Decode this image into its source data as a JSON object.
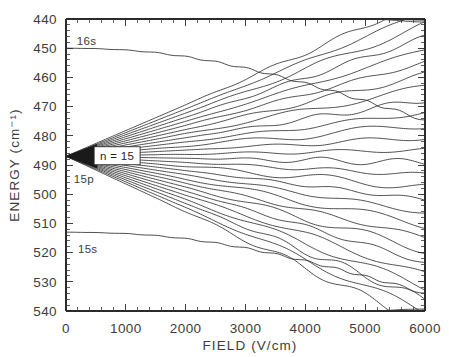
{
  "chart_data": {
    "type": "line",
    "title": "",
    "xlabel": "FIELD   (V/cm)",
    "ylabel": "ENERGY   (cm⁻¹)",
    "xlim": [
      0,
      6000
    ],
    "ylim": [
      540,
      440
    ],
    "y_inverted": true,
    "grid": false,
    "legend_position": "none",
    "x_ticks": [
      0,
      1000,
      2000,
      3000,
      4000,
      5000,
      6000
    ],
    "x_tick_labels": [
      "0",
      "1000",
      "2000",
      "3000",
      "4000",
      "5000",
      "6000"
    ],
    "x_minor_step": 200,
    "y_ticks": [
      440,
      450,
      460,
      470,
      480,
      490,
      500,
      510,
      520,
      530,
      540
    ],
    "y_tick_labels": [
      "440",
      "450",
      "460",
      "470",
      "480",
      "490",
      "500",
      "510",
      "520",
      "530",
      "540"
    ],
    "y_minor_step": 2,
    "annotations": [
      {
        "name": "manifold-label",
        "text": "n = 15",
        "x": 520,
        "y": 487,
        "boxed": true
      },
      {
        "name": "state-label-16s",
        "text": "16s",
        "x": 180,
        "y": 449
      },
      {
        "name": "state-label-15p",
        "text": "15p",
        "x": 130,
        "y": 496
      },
      {
        "name": "state-label-15s",
        "text": "15s",
        "x": 200,
        "y": 520
      }
    ],
    "manifold": {
      "origin_field": 0,
      "origin_energy": 487.0,
      "n": 15,
      "num_levels": 27,
      "slope_min": -0.0088,
      "slope_max": 0.0095,
      "description": "Stark manifold of n=15 hydrogenic levels fanning out linearly from zero field, with avoided crossings at higher field."
    },
    "series": [
      {
        "name": "16s",
        "points": [
          [
            0,
            450.0
          ],
          [
            400,
            450.1
          ],
          [
            900,
            450.5
          ],
          [
            1400,
            451.3
          ],
          [
            1900,
            452.6
          ],
          [
            2400,
            454.3
          ],
          [
            2900,
            456.4
          ],
          [
            3400,
            458.8
          ],
          [
            3900,
            461.5
          ],
          [
            4400,
            464.4
          ],
          [
            4900,
            467.5
          ],
          [
            5400,
            470.7
          ],
          [
            6000,
            474.6
          ]
        ]
      },
      {
        "name": "15s",
        "points": [
          [
            0,
            513.0
          ],
          [
            400,
            513.1
          ],
          [
            900,
            513.4
          ],
          [
            1400,
            514.0
          ],
          [
            1900,
            515.0
          ],
          [
            2400,
            516.4
          ],
          [
            2900,
            518.1
          ],
          [
            3400,
            520.1
          ],
          [
            3900,
            522.4
          ],
          [
            4400,
            524.9
          ],
          [
            4900,
            527.6
          ],
          [
            5400,
            530.4
          ],
          [
            6000,
            533.9
          ]
        ]
      }
    ],
    "colors": {
      "curve": "#2f2f2f",
      "axis": "#2b2b2b",
      "text": "#3d3d3d",
      "background": "#ffffff"
    }
  },
  "plot_geometry": {
    "left": 66,
    "right": 425,
    "top": 19,
    "bottom": 311
  }
}
